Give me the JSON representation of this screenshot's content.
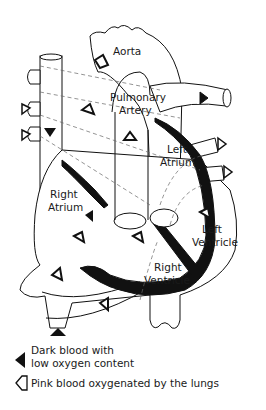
{
  "diagram": {
    "labels": {
      "aorta": "Aorta",
      "pulmonary_artery_1": "Pulmonary",
      "pulmonary_artery_2": "Artery",
      "left_atrium_1": "Left",
      "left_atrium_2": "Atrium",
      "right_atrium_1": "Right",
      "right_atrium_2": "Atrium",
      "left_ventricle_1": "Left",
      "left_ventricle_2": "Ventricle",
      "right_ventricle_1": "Right",
      "right_ventricle_2": "Ventricle"
    },
    "legend": {
      "dark_1": "Dark blood with",
      "dark_2": "low oxygen content",
      "pink": "Pink blood oxygenated by the lungs"
    },
    "colors": {
      "ink": "#111111",
      "background": "#ffffff"
    }
  }
}
